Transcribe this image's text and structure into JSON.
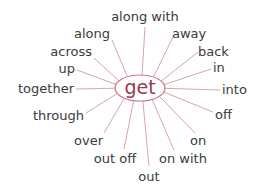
{
  "diagram": {
    "center": {
      "label": "get",
      "x": 140,
      "y": 88,
      "rx": 25,
      "ry": 13
    },
    "colors": {
      "center_text": "#9b3a4e",
      "hub_stroke": "#c77b8a",
      "spokes": "#d9a4ad",
      "labels": "#3a3a3a"
    },
    "nodes": [
      {
        "label": "along with",
        "tx": 145,
        "ty": 21,
        "anchor": "middle",
        "lx": 145,
        "ly": 27
      },
      {
        "label": "along",
        "tx": 110,
        "ty": 38,
        "anchor": "end",
        "lx": 112,
        "ly": 40
      },
      {
        "label": "away",
        "tx": 172,
        "ty": 38,
        "anchor": "start",
        "lx": 174,
        "ly": 35
      },
      {
        "label": "across",
        "tx": 92,
        "ty": 56,
        "anchor": "end",
        "lx": 94,
        "ly": 58
      },
      {
        "label": "back",
        "tx": 198,
        "ty": 56,
        "anchor": "start",
        "lx": 198,
        "ly": 52
      },
      {
        "label": "up",
        "tx": 75,
        "ty": 73,
        "anchor": "end",
        "lx": 77,
        "ly": 70
      },
      {
        "label": "in",
        "tx": 213,
        "ty": 72,
        "anchor": "start",
        "lx": 211,
        "ly": 69
      },
      {
        "label": "together",
        "tx": 74,
        "ty": 93,
        "anchor": "end",
        "lx": 76,
        "ly": 89
      },
      {
        "label": "into",
        "tx": 222,
        "ty": 94,
        "anchor": "start",
        "lx": 220,
        "ly": 90
      },
      {
        "label": "off",
        "tx": 215,
        "ty": 119,
        "anchor": "start",
        "lx": 213,
        "ly": 112
      },
      {
        "label": "through",
        "tx": 84,
        "ty": 120,
        "anchor": "end",
        "lx": 86,
        "ly": 113
      },
      {
        "label": "over",
        "tx": 103,
        "ty": 145,
        "anchor": "end",
        "lx": 104,
        "ly": 133
      },
      {
        "label": "on",
        "tx": 190,
        "ty": 145,
        "anchor": "start",
        "lx": 195,
        "ly": 133
      },
      {
        "label": "out off",
        "tx": 115,
        "ty": 163,
        "anchor": "middle",
        "lx": 124,
        "ly": 149
      },
      {
        "label": "on with",
        "tx": 183,
        "ty": 163,
        "anchor": "middle",
        "lx": 174,
        "ly": 150
      },
      {
        "label": "out",
        "tx": 149,
        "ty": 181,
        "anchor": "middle",
        "lx": 149,
        "ly": 166
      }
    ]
  }
}
